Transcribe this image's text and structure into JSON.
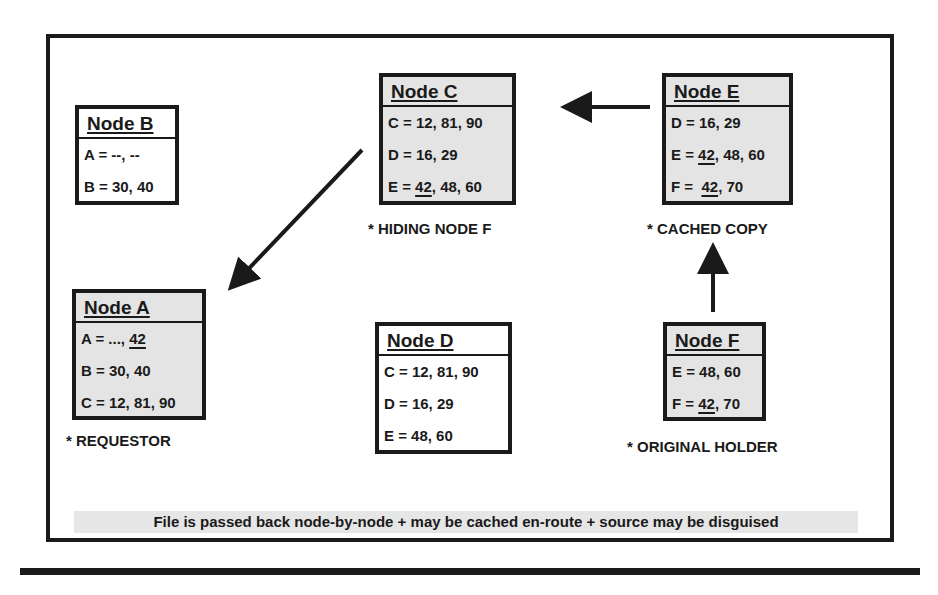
{
  "diagram": {
    "nodes": {
      "b": {
        "title": "Node B",
        "rows": [
          {
            "pre": "A = --, --",
            "u": "",
            "post": ""
          },
          {
            "pre": "B = 30, 40",
            "u": "",
            "post": ""
          }
        ],
        "note": ""
      },
      "c": {
        "title": "Node C",
        "rows": [
          {
            "pre": "C = 12, 81, 90",
            "u": "",
            "post": ""
          },
          {
            "pre": "D = 16, 29",
            "u": "",
            "post": ""
          },
          {
            "pre": "E = ",
            "u": "42",
            "post": ", 48, 60"
          }
        ],
        "note": "* HIDING NODE F"
      },
      "e": {
        "title": "Node E",
        "rows": [
          {
            "pre": "D = 16, 29",
            "u": "",
            "post": ""
          },
          {
            "pre": "E = ",
            "u": "42",
            "post": ", 48, 60"
          },
          {
            "pre": "F =  ",
            "u": "42",
            "post": ", 70"
          }
        ],
        "note": "* CACHED COPY"
      },
      "a": {
        "title": "Node A",
        "rows": [
          {
            "pre": "A = ..., ",
            "u": "42",
            "post": ""
          },
          {
            "pre": "B = 30, 40",
            "u": "",
            "post": ""
          },
          {
            "pre": "C = 12, 81, 90",
            "u": "",
            "post": ""
          }
        ],
        "note": "* REQUESTOR"
      },
      "d": {
        "title": "Node D",
        "rows": [
          {
            "pre": "C = 12, 81, 90",
            "u": "",
            "post": ""
          },
          {
            "pre": "D = 16, 29",
            "u": "",
            "post": ""
          },
          {
            "pre": "E = 48, 60",
            "u": "",
            "post": ""
          }
        ],
        "note": ""
      },
      "f": {
        "title": "Node F",
        "rows": [
          {
            "pre": "E = 48, 60",
            "u": "",
            "post": ""
          },
          {
            "pre": "F = ",
            "u": "42",
            "post": ", 70"
          }
        ],
        "note": "* ORIGINAL HOLDER"
      }
    },
    "arrows": [
      {
        "from": "Node F",
        "to": "Node E"
      },
      {
        "from": "Node E",
        "to": "Node C"
      },
      {
        "from": "Node C",
        "to": "Node A"
      }
    ],
    "caption": "File is passed back node-by-node + may be cached en-route + source may be disguised",
    "colors": {
      "ink": "#1a1a1a",
      "shaded_node": "#e4e4e4",
      "caption_bg": "#e6e6e6"
    }
  }
}
